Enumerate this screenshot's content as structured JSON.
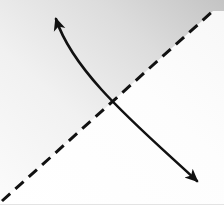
{
  "figure": {
    "title": "Crossing curved arrow and dashed diagonal line",
    "type": "line-art-diagram",
    "width": 224,
    "height": 205,
    "background_color": "#ffffff",
    "ink_color": "#111111",
    "shading": {
      "name": "upper-right-gray-wedge",
      "description": "Soft gray gradient filling the region above the dashed diagonal, darkest toward the top-right corner",
      "color_dark": "#c9c9c9",
      "color_light": "#f4f4f4",
      "opacity": 1
    },
    "elements": [
      {
        "name": "dashed-diagonal-line",
        "kind": "dashed-line",
        "color": "#111111",
        "stroke_width": 3,
        "dash_length": 11,
        "dash_gap": 7,
        "start": [
          2,
          201
        ],
        "end": [
          213,
          11
        ]
      },
      {
        "name": "solid-curved-double-arrow",
        "kind": "curved-arrow",
        "color": "#111111",
        "stroke_width": 2.6,
        "arrowhead_start": true,
        "arrowhead_end": true,
        "start": [
          56,
          19
        ],
        "control1": [
          74,
          74
        ],
        "control2": [
          140,
          128
        ],
        "end": [
          197,
          181
        ]
      },
      {
        "name": "curve-intersection-point",
        "kind": "crossing",
        "position": [
          110,
          113
        ]
      },
      {
        "name": "bottom-edge-rule",
        "kind": "edge-line",
        "color": "#e3e3e3",
        "stroke_width": 1,
        "start": [
          0,
          204
        ],
        "end": [
          224,
          204
        ]
      }
    ]
  }
}
